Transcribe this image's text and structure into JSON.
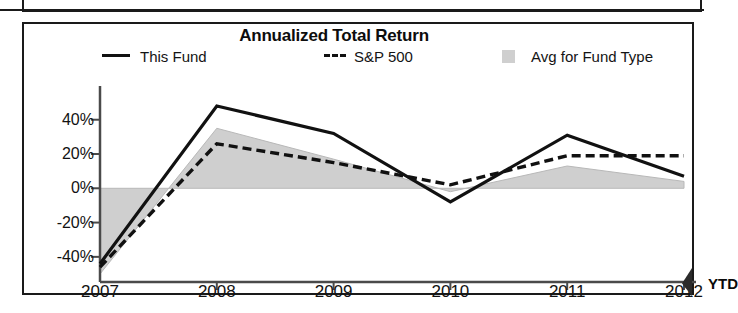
{
  "chart_data": {
    "type": "line",
    "title": "Annualized Total Return",
    "xlabel": "",
    "ylabel": "",
    "x": [
      "2007",
      "2008",
      "2009",
      "2010",
      "2011",
      "2012 YTD"
    ],
    "categories": [
      "2007",
      "2008",
      "2009",
      "2010",
      "2011",
      "2012 YTD"
    ],
    "ylim": [
      -50,
      55
    ],
    "yticks": [
      -40,
      -20,
      0,
      20,
      40
    ],
    "ytick_labels": [
      "-40%",
      "-20%",
      "0%",
      "20%",
      "40%"
    ],
    "grid": false,
    "legend_position": "top",
    "series": [
      {
        "name": "This Fund",
        "style": "solid-line",
        "color": "#111111",
        "values": [
          -44,
          48,
          32,
          -8,
          31,
          7
        ]
      },
      {
        "name": "S&P 500",
        "style": "dashed-line",
        "color": "#111111",
        "values": [
          -46,
          26,
          15,
          2,
          19,
          19
        ]
      },
      {
        "name": "Avg for Fund Type",
        "style": "filled-area",
        "color": "#cfcfcf",
        "values": [
          -50,
          35,
          17,
          -2,
          13,
          4
        ]
      }
    ]
  },
  "chart": {
    "title": "Annualized Total Return",
    "legend": [
      {
        "label": "This Fund",
        "marker": "solid-line-swatch"
      },
      {
        "label": "S&P 500",
        "marker": "dashed-line-swatch"
      },
      {
        "label": "Avg for Fund Type",
        "marker": "area-swatch"
      }
    ],
    "y_axis": {
      "ticks": [
        "40%",
        "20%",
        "0%",
        "-20%",
        "-40%"
      ]
    },
    "x_axis": {
      "ticks": [
        "2007",
        "2008",
        "2009",
        "2010",
        "2011",
        "2012"
      ],
      "suffix": "YTD"
    },
    "colors": {
      "line": "#111111",
      "area": "#cfcfcf",
      "axis": "#4a4a4a",
      "border": "#1a1a1a"
    }
  }
}
